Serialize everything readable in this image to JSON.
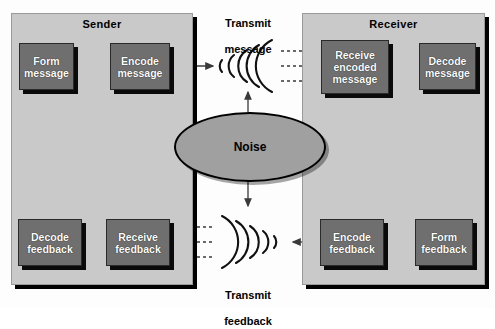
{
  "diagram": {
    "colors": {
      "panel_fill": "#c9c9c9",
      "box_fill": "#6f6f6f",
      "box_text": "#ffffff",
      "noise_fill": "#a0a0a0",
      "outline": "#000000",
      "canvas": "#fdfdfd"
    },
    "panels": [
      {
        "id": "sender",
        "label": "Sender"
      },
      {
        "id": "receiver",
        "label": "Receiver"
      }
    ],
    "boxes": [
      {
        "id": "form-message",
        "label": "Form\nmessage",
        "panel": "sender"
      },
      {
        "id": "encode-message",
        "label": "Encode\nmessage",
        "panel": "sender"
      },
      {
        "id": "receive-encoded-message",
        "label": "Receive\nencoded\nmessage",
        "panel": "receiver"
      },
      {
        "id": "decode-message",
        "label": "Decode\nmessage",
        "panel": "receiver"
      },
      {
        "id": "form-feedback",
        "label": "Form\nfeedback",
        "panel": "receiver"
      },
      {
        "id": "encode-feedback",
        "label": "Encode\nfeedback",
        "panel": "receiver"
      },
      {
        "id": "receive-feedback",
        "label": "Receive\nfeedback",
        "panel": "sender"
      },
      {
        "id": "decode-feedback",
        "label": "Decode\nfeedback",
        "panel": "sender"
      }
    ],
    "noise": {
      "label": "Noise"
    },
    "channel_labels": [
      {
        "id": "transmit-message",
        "line1": "Transmit",
        "line2": "message"
      },
      {
        "id": "transmit-feedback",
        "line1": "Transmit",
        "line2": "feedback"
      }
    ],
    "box_labels": {
      "form_message": "Form\nmessage",
      "encode_message": "Encode\nmessage",
      "receive_encoded_message": "Receive\nencoded\nmessage",
      "decode_message": "Decode\nmessage",
      "form_feedback": "Form\nfeedback",
      "encode_feedback": "Encode\nfeedback",
      "receive_feedback": "Receive\nfeedback",
      "decode_feedback": "Decode\nfeedback"
    },
    "panel_labels": {
      "sender": "Sender",
      "receiver": "Receiver"
    },
    "noise_label": "Noise",
    "transmit_message_l1": "Transmit",
    "transmit_message_l2": "message",
    "transmit_feedback_l1": "Transmit",
    "transmit_feedback_l2": "feedback"
  }
}
